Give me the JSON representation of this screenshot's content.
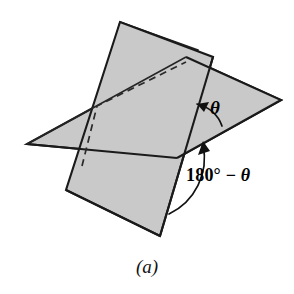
{
  "figure": {
    "caption": "(a)",
    "kind": "geometry-diagram",
    "background_color": "#ffffff",
    "plane_fill_color": "#c9c9c9",
    "edge_color": "#1a1a1a",
    "labels": {
      "theta": "θ",
      "supplement_prefix": "180° − ",
      "supplement_theta": "θ",
      "supplement_full": "180° − θ"
    },
    "annotations": [
      {
        "name": "theta-angle",
        "text": "θ",
        "description": "angle between the upper-right plane edge and the vertical plane above the line of intersection"
      },
      {
        "name": "supplementary-angle",
        "text": "180° − θ",
        "description": "supplementary angle measured below the line of intersection"
      }
    ],
    "geometry": {
      "back_plane_points": "120,22 196,50 168,128 97,106",
      "right_plane_points": "186,57 281,100 176,157 86,120",
      "front_plane_points": "152,59 229,232 160,236 82,165",
      "fold_dashed_path": "82,165 97,106 185,62"
    }
  }
}
